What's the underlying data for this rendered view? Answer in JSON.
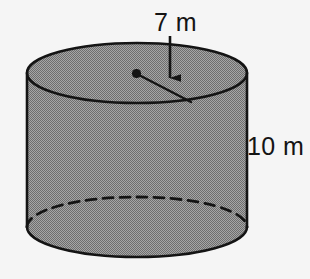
{
  "figure": {
    "shape": "cylinder",
    "background_color": "#f5f5f5",
    "fill_color": "#8a8a8a",
    "outline_color": "#141414",
    "labels": {
      "radius": "7 m",
      "height": "10 m"
    },
    "annotations": {
      "radius_value": 7,
      "radius_unit": "m",
      "height_value": 10,
      "height_unit": "m",
      "center_dot": "center-point-dot",
      "radius_segment": "radius-line",
      "pointer": "down-arrow",
      "hidden_edge_style": "dashed"
    }
  }
}
